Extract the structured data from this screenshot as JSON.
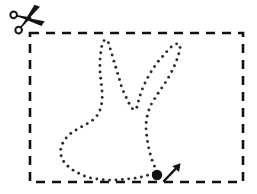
{
  "page": {
    "width": 257,
    "height": 194,
    "background_color": "#ffffff"
  },
  "colors": {
    "ink": "#141414",
    "dot": "#2b2b2b",
    "dash": "#111111",
    "background": "#ffffff"
  },
  "cut_border": {
    "icon": "scissors-icon",
    "shape": "rectangle",
    "style": "dashed",
    "x": 30,
    "y": 33,
    "width": 213,
    "height": 149,
    "stroke_width": 2.6,
    "dash_pattern": "9 7",
    "color": "#111111"
  },
  "scissors": {
    "icon": "scissors-icon",
    "x": 12,
    "y": 6,
    "width": 34,
    "height": 28,
    "color": "#141414",
    "rotation_deg": -18
  },
  "start_marker": {
    "dot": {
      "icon": "start-point-dot-icon",
      "cx": 157,
      "cy": 175,
      "r": 5.2,
      "color": "#111111"
    },
    "arrow": {
      "icon": "direction-arrow-icon",
      "from_x": 163,
      "from_y": 181,
      "to_x": 180,
      "to_y": 163,
      "stroke_width": 2.4,
      "head_size": 6,
      "color": "#111111"
    }
  },
  "traced_figure": {
    "name": "rabbit-outline",
    "style": "dotted",
    "dot_radius": 1.45,
    "dot_color": "#2b2b2b",
    "dot_spacing": 6.4,
    "closed": true,
    "points": [
      [
        157,
        172
      ],
      [
        152,
        160
      ],
      [
        149,
        149
      ],
      [
        147,
        138
      ],
      [
        146,
        127
      ],
      [
        147,
        117
      ],
      [
        150,
        107
      ],
      [
        155,
        98
      ],
      [
        161,
        89
      ],
      [
        167,
        80
      ],
      [
        172,
        71
      ],
      [
        176,
        62
      ],
      [
        179,
        53
      ],
      [
        180,
        45
      ],
      [
        176,
        44
      ],
      [
        170,
        48
      ],
      [
        164,
        55
      ],
      [
        157,
        63
      ],
      [
        151,
        72
      ],
      [
        146,
        81
      ],
      [
        142,
        90
      ],
      [
        139,
        99
      ],
      [
        137,
        107
      ],
      [
        134,
        110
      ],
      [
        130,
        105
      ],
      [
        126,
        97
      ],
      [
        122,
        88
      ],
      [
        119,
        78
      ],
      [
        116,
        68
      ],
      [
        113,
        58
      ],
      [
        110,
        48
      ],
      [
        107,
        40
      ],
      [
        103,
        42
      ],
      [
        101,
        51
      ],
      [
        100,
        61
      ],
      [
        100,
        71
      ],
      [
        101,
        81
      ],
      [
        102,
        91
      ],
      [
        102,
        101
      ],
      [
        100,
        110
      ],
      [
        96,
        117
      ],
      [
        90,
        122
      ],
      [
        83,
        126
      ],
      [
        76,
        130
      ],
      [
        69,
        135
      ],
      [
        64,
        141
      ],
      [
        61,
        148
      ],
      [
        61,
        155
      ],
      [
        64,
        162
      ],
      [
        70,
        168
      ],
      [
        78,
        173
      ],
      [
        87,
        177
      ],
      [
        97,
        179
      ],
      [
        107,
        180
      ],
      [
        117,
        180
      ],
      [
        127,
        179
      ],
      [
        136,
        178
      ],
      [
        145,
        176
      ]
    ]
  },
  "labels": {
    "alt_text": "Dashed rectangular cut-out border with a scissors icon at the top left, a dotted rabbit outline to trace inside, and a filled start dot with an arrow at the bottom."
  }
}
